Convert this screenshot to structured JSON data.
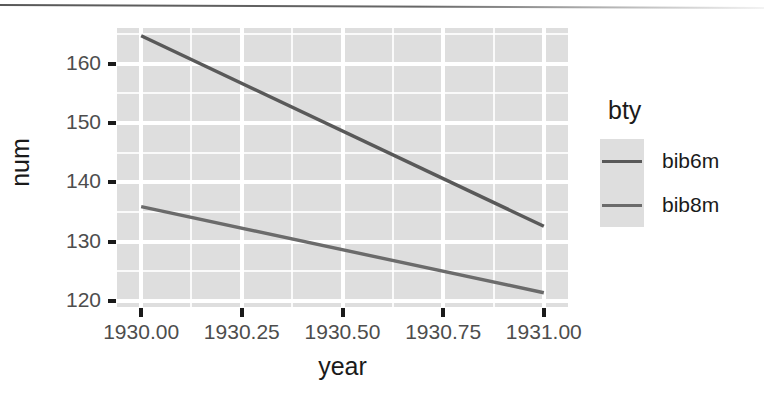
{
  "chart_data": {
    "type": "line",
    "title": "",
    "xlabel": "year",
    "ylabel": "num",
    "xlim": [
      1929.94,
      1931.06
    ],
    "ylim": [
      119.0,
      166.0
    ],
    "grid": true,
    "legend_position": "right",
    "legend_title": "bty",
    "x": [
      1930.0,
      1931.0
    ],
    "xticks": [
      "1930.00",
      "1930.25",
      "1930.50",
      "1930.75",
      "1931.00"
    ],
    "xtick_values": [
      1930.0,
      1930.25,
      1930.5,
      1930.75,
      1931.0
    ],
    "yticks": [
      "120",
      "130",
      "140",
      "150",
      "160"
    ],
    "ytick_values": [
      120,
      130,
      140,
      150,
      160
    ],
    "series": [
      {
        "name": "bib6m",
        "values": [
          164.7,
          132.6
        ],
        "color": "#595959"
      },
      {
        "name": "bib8m",
        "values": [
          135.9,
          121.4
        ],
        "color": "#6b6b6b"
      }
    ],
    "panel_background": "#dedede",
    "grid_color": "#ffffff",
    "axis_text_color": "#4d4d4d",
    "axis_title_color": "#1a1a1a"
  },
  "axis": {
    "y_title": "num",
    "x_title": "year",
    "y_labels": [
      "160",
      "150",
      "140",
      "130",
      "120"
    ],
    "x_labels": [
      "1930.00",
      "1930.25",
      "1930.50",
      "1930.75",
      "1931.00"
    ]
  },
  "legend": {
    "title": "bty",
    "items": [
      {
        "label": "bib6m",
        "color": "#595959"
      },
      {
        "label": "bib8m",
        "color": "#6b6b6b"
      }
    ]
  }
}
